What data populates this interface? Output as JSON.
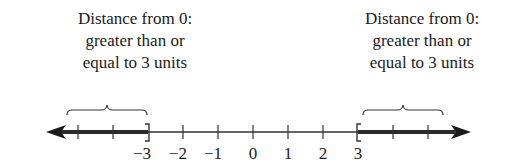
{
  "captions": {
    "left": {
      "lines": [
        "Distance from 0:",
        "greater than or",
        "equal to 3 units"
      ]
    },
    "right": {
      "lines": [
        "Distance from 0:",
        "greater than or",
        "equal to 3 units"
      ]
    }
  },
  "number_line": {
    "ticks": [
      {
        "value": -5,
        "x": 78,
        "label": ""
      },
      {
        "value": -4,
        "x": 113,
        "label": ""
      },
      {
        "value": -3,
        "x": 148,
        "label": "−3"
      },
      {
        "value": -2,
        "x": 183,
        "label": "−2"
      },
      {
        "value": -1,
        "x": 218,
        "label": "−1"
      },
      {
        "value": 0,
        "x": 253,
        "label": "0"
      },
      {
        "value": 1,
        "x": 288,
        "label": "1"
      },
      {
        "value": 2,
        "x": 323,
        "label": "2"
      },
      {
        "value": 3,
        "x": 358,
        "label": "3"
      },
      {
        "value": 4,
        "x": 393,
        "label": ""
      },
      {
        "value": 5,
        "x": 428,
        "label": ""
      }
    ],
    "shaded_regions": [
      {
        "from": "-infinity",
        "to": -3,
        "endpoint": "closed bracket ]"
      },
      {
        "from": 3,
        "to": "infinity",
        "endpoint": "closed bracket ["
      }
    ],
    "line_color": "#333333",
    "shade_color": "#2a2a2a"
  }
}
